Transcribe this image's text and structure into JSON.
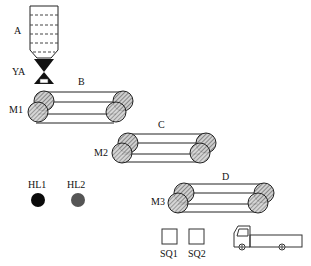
{
  "labels": {
    "hopper": "A",
    "valve": "YA",
    "conveyor_b": "B",
    "conveyor_c": "C",
    "conveyor_d": "D",
    "motor_1": "M1",
    "motor_2": "M2",
    "motor_3": "M3",
    "lamp_1": "HL1",
    "lamp_2": "HL2",
    "switch_1": "SQ1",
    "switch_2": "SQ2"
  },
  "colors": {
    "line": "#222222",
    "hatch": "#555555",
    "lamp_1": "#0a0a0a",
    "lamp_2": "#555555",
    "valve": "#111111"
  }
}
